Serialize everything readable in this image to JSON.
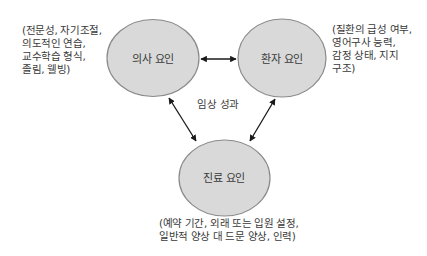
{
  "colors": {
    "ellipse_fill": "#d9d9d9",
    "ellipse_stroke": "#8a8a8a",
    "arrow": "#1a1a1a",
    "text": "#3a3a3a"
  },
  "center_label": "임상 성과",
  "nodes": {
    "physician": {
      "label": "의사 요인",
      "note_lines": [
        "(전문성, 자기조절,",
        "의도적인 연습,",
        "교수학습 형식,",
        "졸림, 웰빙)"
      ]
    },
    "patient": {
      "label": "환자 요인",
      "note_lines": [
        "(질환의 급성 여부,",
        "영어구사 능력,",
        "감정 상태, 지지",
        "구조)"
      ]
    },
    "care": {
      "label": "진료 요인",
      "note_lines": [
        "(예약 기간, 외래 또는 입원 설정,",
        "일반적 양상 대 드문 양상, 인력)"
      ]
    }
  },
  "edges": [
    {
      "from": "physician",
      "to": "patient",
      "type": "bidirectional"
    },
    {
      "from": "physician",
      "to": "care",
      "type": "bidirectional"
    },
    {
      "from": "patient",
      "to": "care",
      "type": "bidirectional"
    }
  ]
}
